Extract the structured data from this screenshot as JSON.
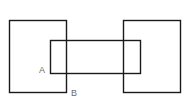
{
  "diagram": {
    "width": 189,
    "height": 106,
    "background": "#ffffff",
    "stroke_color": "#1a1a1a",
    "label_color": "#6a6a6a",
    "shapes": [
      {
        "id": "left-square",
        "type": "rect",
        "x": 9.5,
        "y": 20.5,
        "width": 57,
        "height": 72
      },
      {
        "id": "right-square",
        "type": "rect",
        "x": 123.5,
        "y": 20.5,
        "width": 57,
        "height": 72
      },
      {
        "id": "middle-rectangle",
        "type": "rect",
        "x": 50.5,
        "y": 40.5,
        "width": 90,
        "height": 33
      }
    ],
    "labels": [
      {
        "id": "point-a",
        "text": "A",
        "x": 39,
        "y": 73
      },
      {
        "id": "point-b",
        "text": "B",
        "x": 71,
        "y": 96
      }
    ]
  }
}
